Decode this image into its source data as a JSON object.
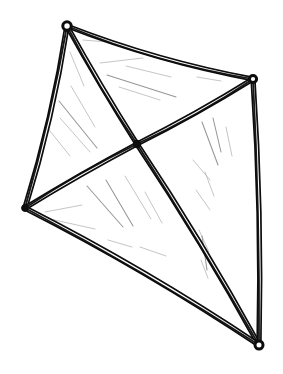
{
  "image": {
    "title": "Hand-drawn wireframe polyhedron sketch",
    "subject": "tetrahedron-kite-frame",
    "style": "ink line drawing, double-stroke edges, hatched shading",
    "width": 283,
    "height": 374,
    "background_color": "#ffffff",
    "ink_color": "#0d0d0d",
    "hatch_color": "#8d8d8d",
    "hatch_color_faint": "#b3b3b3"
  },
  "geometry": {
    "vertices": [
      {
        "id": "top",
        "name": "top-vertex",
        "x": 67,
        "y": 26,
        "knob": "open-loop",
        "radius": 4.2
      },
      {
        "id": "right",
        "name": "right-vertex",
        "x": 253,
        "y": 79,
        "knob": "open-loop",
        "radius": 3.6
      },
      {
        "id": "left",
        "name": "left-vertex",
        "x": 25,
        "y": 208,
        "knob": "solid-dot",
        "radius": 3.4
      },
      {
        "id": "center",
        "name": "center-vertex",
        "x": 137,
        "y": 144,
        "knob": "solid-dot",
        "radius": 3.8
      },
      {
        "id": "bottom",
        "name": "bottom-vertex",
        "x": 259,
        "y": 345,
        "knob": "open-loop",
        "radius": 4.0
      }
    ],
    "edges": [
      {
        "id": "e-top-right",
        "name": "edge-top-to-right",
        "from": "top",
        "to": "right",
        "bow": 9,
        "width": 5.0
      },
      {
        "id": "e-top-left",
        "name": "edge-top-to-left",
        "from": "top",
        "to": "left",
        "bow": -7,
        "width": 5.6
      },
      {
        "id": "e-top-center",
        "name": "edge-top-to-center",
        "from": "top",
        "to": "center",
        "bow": 2,
        "width": 5.2
      },
      {
        "id": "e-center-right",
        "name": "edge-center-to-right",
        "from": "center",
        "to": "right",
        "bow": 3,
        "width": 5.2
      },
      {
        "id": "e-center-left",
        "name": "edge-center-to-left",
        "from": "center",
        "to": "left",
        "bow": 2,
        "width": 5.0
      },
      {
        "id": "e-center-bottom",
        "name": "edge-center-to-bottom",
        "from": "center",
        "to": "bottom",
        "bow": -5,
        "width": 5.4
      },
      {
        "id": "e-right-bottom",
        "name": "edge-right-to-bottom",
        "from": "right",
        "to": "bottom",
        "bow": -6,
        "width": 5.4
      },
      {
        "id": "e-left-bottom",
        "name": "edge-left-to-bottom",
        "from": "left",
        "to": "bottom",
        "bow": -8,
        "width": 5.4
      }
    ],
    "faces": [
      {
        "id": "f-top",
        "name": "panel-top",
        "vertices": [
          "top",
          "right",
          "center"
        ]
      },
      {
        "id": "f-left",
        "name": "panel-left",
        "vertices": [
          "top",
          "center",
          "left"
        ]
      },
      {
        "id": "f-right",
        "name": "panel-right",
        "vertices": [
          "center",
          "right",
          "bottom"
        ]
      },
      {
        "id": "f-bottom",
        "name": "panel-bottom-left",
        "vertices": [
          "center",
          "bottom",
          "left"
        ]
      }
    ]
  },
  "hatching": {
    "strokes": [
      {
        "x1": 100,
        "y1": 63,
        "x2": 143,
        "y2": 58,
        "tone": "faint"
      },
      {
        "x1": 107,
        "y1": 75,
        "x2": 176,
        "y2": 97,
        "tone": "normal"
      },
      {
        "x1": 119,
        "y1": 87,
        "x2": 160,
        "y2": 100,
        "tone": "faint"
      },
      {
        "x1": 126,
        "y1": 66,
        "x2": 171,
        "y2": 77,
        "tone": "faint"
      },
      {
        "x1": 197,
        "y1": 77,
        "x2": 221,
        "y2": 81,
        "tone": "faint"
      },
      {
        "x1": 83,
        "y1": 40,
        "x2": 120,
        "y2": 43,
        "tone": "faint"
      },
      {
        "x1": 70,
        "y1": 52,
        "x2": 84,
        "y2": 86,
        "tone": "faint"
      },
      {
        "x1": 59,
        "y1": 101,
        "x2": 97,
        "y2": 148,
        "tone": "normal"
      },
      {
        "x1": 60,
        "y1": 118,
        "x2": 90,
        "y2": 152,
        "tone": "faint"
      },
      {
        "x1": 46,
        "y1": 126,
        "x2": 70,
        "y2": 156,
        "tone": "faint"
      },
      {
        "x1": 71,
        "y1": 86,
        "x2": 95,
        "y2": 127,
        "tone": "faint"
      },
      {
        "x1": 202,
        "y1": 122,
        "x2": 218,
        "y2": 165,
        "tone": "normal"
      },
      {
        "x1": 213,
        "y1": 118,
        "x2": 221,
        "y2": 152,
        "tone": "normal"
      },
      {
        "x1": 226,
        "y1": 127,
        "x2": 232,
        "y2": 156,
        "tone": "faint"
      },
      {
        "x1": 193,
        "y1": 160,
        "x2": 210,
        "y2": 180,
        "tone": "faint"
      },
      {
        "x1": 205,
        "y1": 172,
        "x2": 214,
        "y2": 196,
        "tone": "faint"
      },
      {
        "x1": 196,
        "y1": 190,
        "x2": 210,
        "y2": 210,
        "tone": "faint"
      },
      {
        "x1": 199,
        "y1": 230,
        "x2": 209,
        "y2": 252,
        "tone": "faint"
      },
      {
        "x1": 201,
        "y1": 260,
        "x2": 208,
        "y2": 278,
        "tone": "faint"
      },
      {
        "x1": 45,
        "y1": 212,
        "x2": 82,
        "y2": 205,
        "tone": "faint"
      },
      {
        "x1": 50,
        "y1": 219,
        "x2": 95,
        "y2": 229,
        "tone": "faint"
      },
      {
        "x1": 87,
        "y1": 186,
        "x2": 123,
        "y2": 227,
        "tone": "normal"
      },
      {
        "x1": 106,
        "y1": 180,
        "x2": 133,
        "y2": 226,
        "tone": "normal"
      },
      {
        "x1": 125,
        "y1": 176,
        "x2": 151,
        "y2": 219,
        "tone": "faint"
      },
      {
        "x1": 145,
        "y1": 192,
        "x2": 162,
        "y2": 223,
        "tone": "faint"
      },
      {
        "x1": 108,
        "y1": 240,
        "x2": 132,
        "y2": 247,
        "tone": "faint"
      },
      {
        "x1": 140,
        "y1": 247,
        "x2": 166,
        "y2": 256,
        "tone": "faint"
      },
      {
        "x1": 202,
        "y1": 236,
        "x2": 207,
        "y2": 270,
        "tone": "normal"
      }
    ]
  }
}
